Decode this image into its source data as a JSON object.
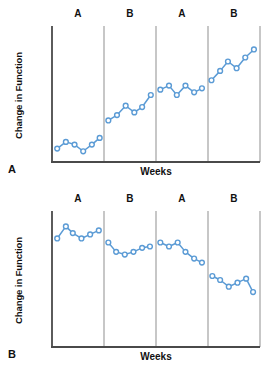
{
  "figure": {
    "caption_letters": [
      "A",
      "B"
    ]
  },
  "chart_data": [
    {
      "type": "line",
      "title": "",
      "panel_letter": "A",
      "xlabel": "Weeks",
      "ylabel": "Change in Function",
      "xlim": [
        0,
        24
      ],
      "ylim": [
        0,
        10
      ],
      "grid": false,
      "legend": "none",
      "phase_labels": [
        "A",
        "B",
        "A",
        "B"
      ],
      "phase_boundaries": [
        6,
        12,
        18
      ],
      "annotation": "ABAB reversal design showing increasing change in function",
      "series": [
        {
          "name": "Phase A1",
          "label": "A",
          "x": [
            0.6,
            1.6,
            2.6,
            3.6,
            4.6,
            5.5
          ],
          "values": [
            1.0,
            1.5,
            1.3,
            0.8,
            1.3,
            1.8
          ]
        },
        {
          "name": "Phase B1",
          "label": "B",
          "x": [
            6.5,
            7.5,
            8.5,
            9.5,
            10.4,
            11.4
          ],
          "values": [
            3.1,
            3.5,
            4.2,
            3.7,
            4.1,
            5.0
          ]
        },
        {
          "name": "Phase A2",
          "label": "A",
          "x": [
            12.5,
            13.5,
            14.4,
            15.4,
            16.4,
            17.3
          ],
          "values": [
            5.4,
            5.7,
            5.0,
            5.7,
            5.2,
            5.5
          ]
        },
        {
          "name": "Phase B2",
          "label": "B",
          "x": [
            18.4,
            19.4,
            20.3,
            21.3,
            22.3,
            23.3
          ],
          "values": [
            6.1,
            6.8,
            7.5,
            7.0,
            7.8,
            8.4
          ]
        }
      ]
    },
    {
      "type": "line",
      "title": "",
      "panel_letter": "B",
      "xlabel": "Weeks",
      "ylabel": "Change in Function",
      "xlim": [
        0,
        24
      ],
      "ylim": [
        0,
        10
      ],
      "grid": false,
      "legend": "none",
      "phase_labels": [
        "A",
        "B",
        "A",
        "B"
      ],
      "phase_boundaries": [
        6,
        12,
        18
      ],
      "annotation": "ABAB reversal design showing decreasing change in function",
      "series": [
        {
          "name": "Phase A1",
          "label": "A",
          "x": [
            0.6,
            1.6,
            2.4,
            3.4,
            4.4,
            5.4
          ],
          "values": [
            8.1,
            9.0,
            8.5,
            8.1,
            8.4,
            8.7
          ]
        },
        {
          "name": "Phase B1",
          "label": "B",
          "x": [
            6.5,
            7.4,
            8.4,
            9.4,
            10.4,
            11.3
          ],
          "values": [
            7.8,
            7.1,
            6.9,
            7.1,
            7.4,
            7.5
          ]
        },
        {
          "name": "Phase A2",
          "label": "A",
          "x": [
            12.5,
            13.5,
            14.5,
            15.4,
            16.4,
            17.3
          ],
          "values": [
            7.8,
            7.5,
            7.8,
            7.1,
            6.6,
            6.3
          ]
        },
        {
          "name": "Phase B2",
          "label": "B",
          "x": [
            18.5,
            19.4,
            20.4,
            21.4,
            22.4,
            23.2
          ],
          "values": [
            5.3,
            5.0,
            4.5,
            4.8,
            5.1,
            4.1
          ]
        }
      ]
    }
  ],
  "style": {
    "line_color": "#5b9bd5",
    "marker_fill": "#ffffff",
    "axis_color": "#4a4a4a",
    "divider_color": "#8f8f8f",
    "background": "#ffffff"
  }
}
